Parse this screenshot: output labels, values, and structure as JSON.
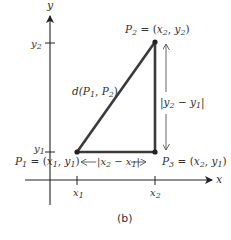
{
  "figure": {
    "caption": "(b)",
    "axes": {
      "x_label": "x",
      "y_label": "y",
      "x_ticks": [
        {
          "base": "x",
          "sub": "1"
        },
        {
          "base": "x",
          "sub": "2"
        }
      ],
      "y_ticks": [
        {
          "base": "y",
          "sub": "2"
        },
        {
          "base": "y",
          "sub": "1"
        }
      ]
    },
    "points": {
      "p1": {
        "name": "P",
        "sub": "1",
        "eq": " = (",
        "cx": "x",
        "cxs": "1",
        "comma": ", ",
        "cy": "y",
        "cys": "1",
        "close": ")"
      },
      "p2": {
        "name": "P",
        "sub": "2",
        "eq": " = (",
        "cx": "x",
        "cxs": "2",
        "comma": ", ",
        "cy": "y",
        "cys": "2",
        "close": ")"
      },
      "p3": {
        "name": "P",
        "sub": "3",
        "eq": " = (",
        "cx": "x",
        "cxs": "2",
        "comma": ", ",
        "cy": "y",
        "cys": "1",
        "close": ")"
      }
    },
    "distance_label": {
      "d": "d(",
      "p": "P",
      "s1": "1",
      "comma": ", ",
      "p2": "P",
      "s2": "2",
      "close": ")"
    },
    "horizontal_label": {
      "open": "|",
      "a": "x",
      "as": "2",
      "minus": " − ",
      "b": "x",
      "bs": "1",
      "close": "|"
    },
    "vertical_label": {
      "open": "|",
      "a": "y",
      "as": "2",
      "minus": " − ",
      "b": "y",
      "bs": "1",
      "close": "|"
    },
    "colors": {
      "axis": "#222222",
      "triangle": "#3a3a3a",
      "arrow": "#555555",
      "text": "#333333"
    }
  }
}
